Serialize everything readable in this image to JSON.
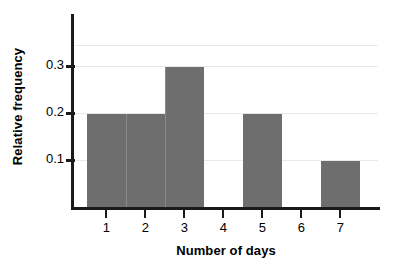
{
  "chart_data": {
    "type": "bar",
    "title": "",
    "subtitle": "",
    "xlabel": "Number of days",
    "ylabel": "Relative frequency",
    "categories": [
      "1",
      "2",
      "3",
      "4",
      "5",
      "6",
      "7"
    ],
    "values": [
      0.2,
      0.2,
      0.3,
      0,
      0.2,
      0,
      0.1
    ],
    "series": [
      {
        "name": "Relative frequency",
        "values": [
          0.2,
          0.2,
          0.3,
          0,
          0.2,
          0,
          0.1
        ]
      }
    ],
    "xlim": [
      0.5,
      7.5
    ],
    "ylim": [
      0,
      0.345
    ],
    "ytick_labels": [
      "0.1",
      "0.2",
      "0.3"
    ],
    "ytick_values": [
      0.1,
      0.2,
      0.3
    ],
    "xtick_labels": [
      "1",
      "2",
      "3",
      "4",
      "5",
      "6",
      "7"
    ],
    "grid": "horizontal",
    "legend": "none",
    "annotations": [],
    "colors": {
      "bar": "#6e6e6e",
      "bar_edge": "#8a8a8a",
      "axis": "#1a1a1a",
      "grid": "#e9e9e9",
      "text": "#000000",
      "background": "#ffffff"
    }
  }
}
